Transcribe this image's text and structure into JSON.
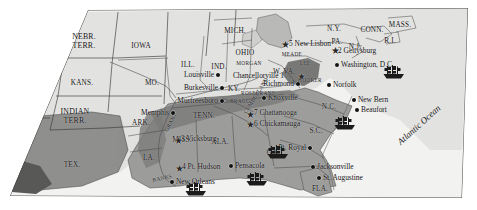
{
  "map": {
    "title": "American Civil War 1863 campaign map",
    "colors": {
      "union_territory": "#e2e2e0",
      "confederate_states": "#9d9d9b",
      "contested_area": "#7d7d7b",
      "ocean": "#f2f2f0",
      "texas_shade": "#8f8f8d",
      "border": "#3a3a3a",
      "label": "#111111"
    },
    "ocean_label": "Atlantic Ocean",
    "states": [
      {
        "name": "NEBR. TERR.",
        "lines": [
          "NEBR.",
          "TERR."
        ],
        "x": 84,
        "y": 33
      },
      {
        "name": "IOWA",
        "lines": [
          "IOWA"
        ],
        "x": 141,
        "y": 43
      },
      {
        "name": "KANS.",
        "lines": [
          "KANS."
        ],
        "x": 82,
        "y": 80
      },
      {
        "name": "MO.",
        "lines": [
          "MO."
        ],
        "x": 152,
        "y": 80
      },
      {
        "name": "ILL.",
        "lines": [
          "ILL."
        ],
        "x": 188,
        "y": 62
      },
      {
        "name": "IND.",
        "lines": [
          "IND."
        ],
        "x": 219,
        "y": 64
      },
      {
        "name": "MICH.",
        "lines": [
          "MICH."
        ],
        "x": 235,
        "y": 28
      },
      {
        "name": "OHIO",
        "lines": [
          "OHIO"
        ],
        "x": 245,
        "y": 50
      },
      {
        "name": "INDIAN TERR.",
        "lines": [
          "INDIAN",
          "TERR."
        ],
        "x": 75,
        "y": 108
      },
      {
        "name": "TEX.",
        "lines": [
          "TEX."
        ],
        "x": 72,
        "y": 162
      },
      {
        "name": "ARK.",
        "lines": [
          "ARK."
        ],
        "x": 141,
        "y": 120
      },
      {
        "name": "LA.",
        "lines": [
          "LA."
        ],
        "x": 149,
        "y": 155
      },
      {
        "name": "MISS.",
        "lines": [
          "MISS."
        ],
        "x": 182,
        "y": 137
      },
      {
        "name": "ALA.",
        "lines": [
          "ALA."
        ],
        "x": 220,
        "y": 139
      },
      {
        "name": "TENN.",
        "lines": [
          "TENN."
        ],
        "x": 204,
        "y": 113
      },
      {
        "name": "KY.",
        "lines": [
          "KY."
        ],
        "x": 234,
        "y": 86
      },
      {
        "name": "GA.",
        "lines": [
          "GA."
        ],
        "x": 273,
        "y": 150
      },
      {
        "name": "FLA.",
        "lines": [
          "FLA."
        ],
        "x": 320,
        "y": 186
      },
      {
        "name": "S.C.",
        "lines": [
          "S.C."
        ],
        "x": 316,
        "y": 128
      },
      {
        "name": "N.C.",
        "lines": [
          "N.C."
        ],
        "x": 329,
        "y": 104
      },
      {
        "name": "W. VA.",
        "lines": [
          "W. VA."
        ],
        "x": 284,
        "y": 69
      },
      {
        "name": "N.Y.",
        "lines": [
          "N.Y."
        ],
        "x": 334,
        "y": 26
      },
      {
        "name": "PA.",
        "lines": [
          "PA."
        ],
        "x": 337,
        "y": 39
      },
      {
        "name": "N.J.",
        "lines": [
          "N.J."
        ],
        "x": 355,
        "y": 44
      },
      {
        "name": "CONN.",
        "lines": [
          "CONN."
        ],
        "x": 372,
        "y": 27
      },
      {
        "name": "R.I.",
        "lines": [
          "R.I."
        ],
        "x": 390,
        "y": 38
      },
      {
        "name": "MASS.",
        "lines": [
          "MASS."
        ],
        "x": 400,
        "y": 22
      }
    ],
    "cities": [
      {
        "name": "Louisville",
        "label": "Louisville",
        "x": 218,
        "y": 75,
        "align": "right",
        "dot": true
      },
      {
        "name": "Burkesville",
        "label": "Burkesville",
        "x": 222,
        "y": 88,
        "align": "right",
        "dot": true
      },
      {
        "name": "Murfreesboro",
        "label": "Murfreesboro",
        "x": 222,
        "y": 101,
        "align": "right",
        "dot": true
      },
      {
        "name": "Memphis",
        "label": "Memphis",
        "x": 173,
        "y": 113,
        "align": "right",
        "dot": true
      },
      {
        "name": "Knoxville",
        "label": "Knoxville",
        "x": 264,
        "y": 98,
        "align": "left",
        "dot": true
      },
      {
        "name": "Richmond",
        "label": "Richmond",
        "x": 298,
        "y": 84,
        "align": "right",
        "dot": true
      },
      {
        "name": "Norfolk",
        "label": "Norfolk",
        "x": 329,
        "y": 85,
        "align": "left",
        "dot": true
      },
      {
        "name": "Washington",
        "label": "Washington, D.C.",
        "x": 337,
        "y": 65,
        "align": "left",
        "dot": true
      },
      {
        "name": "New Bern",
        "label": "New Bern",
        "x": 354,
        "y": 100,
        "align": "left",
        "dot": true
      },
      {
        "name": "Beaufort",
        "label": "Beaufort",
        "x": 357,
        "y": 110,
        "align": "left",
        "dot": true
      },
      {
        "name": "Port Royal",
        "label": "Pt. Royal",
        "x": 310,
        "y": 148,
        "align": "right",
        "dot": true
      },
      {
        "name": "Jacksonville",
        "label": "Jacksonville",
        "x": 313,
        "y": 167,
        "align": "left",
        "dot": true
      },
      {
        "name": "St. Augustine",
        "label": "St. Augustine",
        "x": 319,
        "y": 178,
        "align": "left",
        "dot": true
      },
      {
        "name": "Pensacola",
        "label": "Pensacola",
        "x": 231,
        "y": 166,
        "align": "left",
        "dot": true
      },
      {
        "name": "New Orleans",
        "label": "New Orleans",
        "x": 172,
        "y": 182,
        "align": "left",
        "dot": true
      }
    ],
    "battles": [
      {
        "number": "1",
        "name": "Chancellorville",
        "label": "Chancellorville 1",
        "x": 288,
        "y": 76,
        "align": "right",
        "star_x": 297,
        "star_y": 72
      },
      {
        "number": "2",
        "name": "Gettysburg",
        "label": "2 Gettysburg",
        "x": 334,
        "y": 51,
        "align": "left",
        "star_x": 331,
        "star_y": 46
      },
      {
        "number": "3",
        "name": "Vicksburg",
        "label": "3 Vicksburg",
        "x": 177,
        "y": 139,
        "align": "left",
        "star_x": 174,
        "star_y": 136
      },
      {
        "number": "4",
        "name": "Pt. Hudson",
        "label": "4 Pt. Hudson",
        "x": 178,
        "y": 167,
        "align": "left",
        "star_x": 175,
        "star_y": 164
      },
      {
        "number": "5",
        "name": "New Lisbon",
        "label": "5 New Lisbon",
        "x": 285,
        "y": 44,
        "align": "left",
        "star_x": 281,
        "star_y": 40
      },
      {
        "number": "6",
        "name": "Chickamauga",
        "label": "6 Chickamauga",
        "x": 250,
        "y": 124,
        "align": "left",
        "star_x": 246,
        "star_y": 120
      },
      {
        "number": "7",
        "name": "Chattanooga",
        "label": "7 Chattanooga",
        "x": 250,
        "y": 113,
        "align": "left",
        "star_x": 246,
        "star_y": 110
      }
    ],
    "commanders": [
      {
        "name": "MEADE",
        "label": "MEADE",
        "x": 292,
        "y": 52
      },
      {
        "name": "LEE",
        "label": "LEE",
        "x": 305,
        "y": 61
      },
      {
        "name": "HOOKER",
        "label": "HOOKER",
        "x": 310,
        "y": 78
      },
      {
        "name": "BRAGG",
        "label": "BRAGG",
        "x": 240,
        "y": 99
      },
      {
        "name": "ROSECRANS",
        "label": "ROSECRANS",
        "x": 258,
        "y": 91
      },
      {
        "name": "MORGAN",
        "label": "MORGAN",
        "x": 249,
        "y": 61
      },
      {
        "name": "MICHIGAN-RAID",
        "label": "MORGAN",
        "x": 249,
        "y": 61
      }
    ],
    "rivers": [
      {
        "name": "GRANT",
        "label": "GRANT",
        "x": 164,
        "y": 130,
        "rotate": -62
      },
      {
        "name": "BANKS",
        "label": "BANKS",
        "x": 152,
        "y": 178,
        "rotate": -12
      },
      {
        "name": "CUMBERLAND",
        "label": "CUMBERLAND",
        "x": 243,
        "y": 112,
        "rotate": -58
      }
    ],
    "ships": [
      {
        "name": "ship-atlantic-virginia",
        "x": 394,
        "y": 72
      },
      {
        "name": "ship-carolina-coast",
        "x": 345,
        "y": 123
      },
      {
        "name": "ship-florida-coast",
        "x": 278,
        "y": 152
      },
      {
        "name": "ship-gulf-pensacola",
        "x": 257,
        "y": 179
      },
      {
        "name": "ship-gulf-mississippi",
        "x": 196,
        "y": 189
      }
    ]
  }
}
